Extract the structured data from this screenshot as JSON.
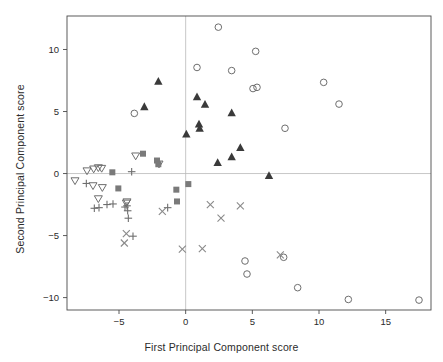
{
  "chart_data": {
    "type": "scatter",
    "title": "",
    "xlabel": "First Principal Component score",
    "ylabel": "Second Principal Component score",
    "xlim": [
      -8.9,
      18.4
    ],
    "ylim": [
      -11.0,
      12.7
    ],
    "xticks": [
      -5,
      0,
      5,
      10,
      15
    ],
    "yticks": [
      -10,
      -5,
      0,
      5,
      10
    ],
    "xtick_labels": [
      "−5",
      "0",
      "5",
      "10",
      "15"
    ],
    "ytick_labels": [
      "−10",
      "−5",
      "0",
      "5",
      "10"
    ],
    "grid": false,
    "reference_lines": {
      "hline_y": 0,
      "vline_x": 0,
      "color": "#b9b9b9"
    },
    "frame": true,
    "legend": null,
    "colors": {
      "open_circle": "#6e6e6e",
      "filled_triangle_up": "#3a3a3a",
      "open_triangle_down": "#6e6e6e",
      "filled_square": "#7a7a7a",
      "plus": "#6e6e6e",
      "cross": "#8a8a8a",
      "axis": "#4a4a4a",
      "reference": "#bdbdbd",
      "text": "#2b2b2b"
    },
    "series": [
      {
        "name": "open-circle",
        "marker": "open-circle",
        "color": "#6e6e6e",
        "points": [
          [
            -3.85,
            4.85
          ],
          [
            0.85,
            8.55
          ],
          [
            2.45,
            11.8
          ],
          [
            3.45,
            8.3
          ],
          [
            5.25,
            9.85
          ],
          [
            5.05,
            6.85
          ],
          [
            5.35,
            6.95
          ],
          [
            7.45,
            3.65
          ],
          [
            10.35,
            7.35
          ],
          [
            11.5,
            5.6
          ],
          [
            4.45,
            -7.05
          ],
          [
            4.6,
            -8.1
          ],
          [
            7.35,
            -6.75
          ],
          [
            8.4,
            -9.2
          ],
          [
            12.2,
            -10.15
          ],
          [
            17.5,
            -10.2
          ]
        ]
      },
      {
        "name": "filled-triangle-up",
        "marker": "filled-triangle-up",
        "color": "#3a3a3a",
        "points": [
          [
            -2.05,
            7.45
          ],
          [
            -3.1,
            5.4
          ],
          [
            0.05,
            3.2
          ],
          [
            0.85,
            6.2
          ],
          [
            1.45,
            5.6
          ],
          [
            1.0,
            4.0
          ],
          [
            1.05,
            3.65
          ],
          [
            3.45,
            4.9
          ],
          [
            4.1,
            2.1
          ],
          [
            3.45,
            1.35
          ],
          [
            2.4,
            0.9
          ],
          [
            6.25,
            -0.15
          ]
        ]
      },
      {
        "name": "open-triangle-down",
        "marker": "open-triangle-down",
        "color": "#6e6e6e",
        "points": [
          [
            -8.3,
            -0.6
          ],
          [
            -7.4,
            0.2
          ],
          [
            -6.9,
            0.35
          ],
          [
            -6.55,
            0.45
          ],
          [
            -6.3,
            0.4
          ],
          [
            -6.95,
            -1.0
          ],
          [
            -6.25,
            -1.15
          ],
          [
            -6.55,
            -2.05
          ],
          [
            -4.45,
            -2.4
          ],
          [
            -4.4,
            -2.3
          ],
          [
            -3.75,
            1.4
          ],
          [
            -2.0,
            0.75
          ]
        ]
      },
      {
        "name": "filled-square",
        "marker": "filled-square",
        "color": "#7a7a7a",
        "points": [
          [
            -5.5,
            0.1
          ],
          [
            -3.2,
            1.6
          ],
          [
            -2.15,
            1.05
          ],
          [
            -2.05,
            0.75
          ],
          [
            -5.05,
            -1.2
          ],
          [
            -0.7,
            -1.3
          ],
          [
            0.2,
            -0.85
          ],
          [
            -0.65,
            -2.25
          ]
        ]
      },
      {
        "name": "plus",
        "marker": "plus",
        "color": "#6e6e6e",
        "points": [
          [
            -7.45,
            -0.8
          ],
          [
            -4.05,
            0.15
          ],
          [
            -6.85,
            -2.8
          ],
          [
            -6.5,
            -2.75
          ],
          [
            -5.9,
            -2.5
          ],
          [
            -5.45,
            -2.45
          ],
          [
            -4.55,
            -2.7
          ],
          [
            -4.4,
            -2.6
          ],
          [
            -4.35,
            -3.0
          ],
          [
            -4.3,
            -3.6
          ],
          [
            -3.95,
            -5.05
          ],
          [
            -1.35,
            -2.75
          ]
        ]
      },
      {
        "name": "cross",
        "marker": "cross",
        "color": "#8a8a8a",
        "points": [
          [
            -4.45,
            -4.85
          ],
          [
            -4.6,
            -5.6
          ],
          [
            -1.75,
            -3.05
          ],
          [
            -0.25,
            -6.1
          ],
          [
            1.25,
            -6.05
          ],
          [
            1.85,
            -2.5
          ],
          [
            2.65,
            -3.6
          ],
          [
            4.1,
            -2.6
          ],
          [
            7.1,
            -6.55
          ]
        ]
      }
    ]
  }
}
